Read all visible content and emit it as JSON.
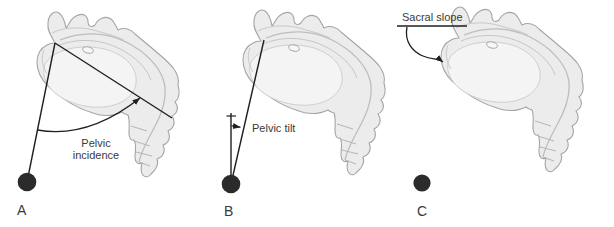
{
  "figure": {
    "panels": [
      {
        "caption": "A",
        "measure": "Pelvic incidence",
        "label_line1": "Pelvic",
        "label_line2": "incidence"
      },
      {
        "caption": "B",
        "measure": "Pelvic tilt",
        "label": "Pelvic tilt"
      },
      {
        "caption": "C",
        "measure": "Sacral slope",
        "label": "Sacral slope"
      }
    ],
    "colors": {
      "annotation_line": "#1f1f1f",
      "text": "#3a3a3a",
      "bone_fill": "#ececec",
      "bone_outline": "#a5a5a5",
      "bone_detail": "#bdbdbd",
      "bone_highlight": "#f4f4f4",
      "dot": "#2b2b2b",
      "background": "#ffffff"
    }
  }
}
